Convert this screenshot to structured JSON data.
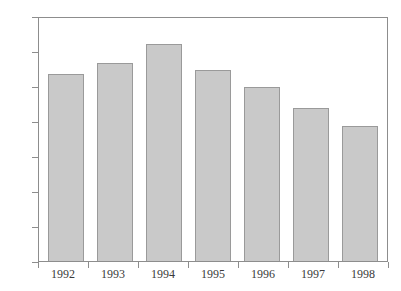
{
  "chart_data": {
    "type": "bar",
    "title": "",
    "subtitle": "",
    "xlabel": "",
    "ylabel": "",
    "categories": [
      "1992",
      "1993",
      "1994",
      "1995",
      "1996",
      "1997",
      "1998"
    ],
    "values": [
      108,
      114,
      125,
      110,
      100,
      88,
      78
    ],
    "ylim": [
      0,
      140
    ],
    "yticks": [
      0,
      20,
      40,
      60,
      80,
      100,
      120,
      140
    ],
    "ytick_labels": [
      "0",
      "20",
      "40",
      "60",
      "80",
      "100",
      "120",
      "140"
    ],
    "xtick_labels": [
      "1992",
      "1993",
      "1994",
      "1995",
      "1996",
      "1997",
      "1998"
    ],
    "grid": false,
    "legend": null,
    "legend_position": "none",
    "annotations": [],
    "colors": {
      "bar_fill": "#c9c9c9",
      "bar_edge": "#9a9a9a",
      "axis": "#8d8d8d",
      "text": "#3a3a3a",
      "background": "#ffffff"
    }
  }
}
